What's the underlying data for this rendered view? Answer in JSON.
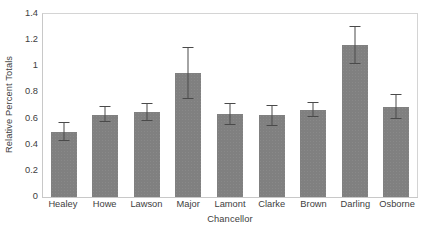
{
  "chart_data": {
    "type": "bar",
    "title": "",
    "xlabel": "Chancellor",
    "ylabel": "Relative Percent Totals",
    "categories": [
      "Healey",
      "Howe",
      "Lawson",
      "Major",
      "Lamont",
      "Clarke",
      "Brown",
      "Darling",
      "Osborne"
    ],
    "values": [
      0.5,
      0.63,
      0.65,
      0.95,
      0.635,
      0.625,
      0.665,
      1.165,
      0.69
    ],
    "errors_low": [
      0.43,
      0.57,
      0.58,
      0.75,
      0.55,
      0.545,
      0.61,
      1.02,
      0.6
    ],
    "errors_high": [
      0.57,
      0.7,
      0.72,
      1.15,
      0.72,
      0.705,
      0.725,
      1.31,
      0.79
    ],
    "ylim": [
      0,
      1.4
    ],
    "yticks": [
      0,
      0.2,
      0.4,
      0.6,
      0.8,
      1,
      1.2,
      1.4
    ],
    "ytick_labels": [
      "0",
      "0.2",
      "0.4",
      "0.6",
      "0.8",
      "1",
      "1.2",
      "1.4"
    ],
    "grid": false,
    "legend": null,
    "bar_color": "#808080",
    "error_color": "#4a4a4a",
    "axis_color": "#c8c8c8",
    "text_color": "#404040",
    "background": "#ffffff"
  }
}
